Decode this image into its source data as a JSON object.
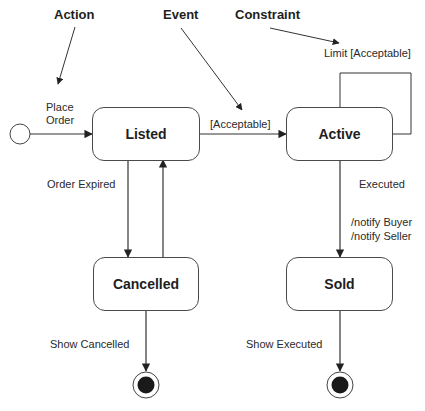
{
  "diagram": {
    "type": "uml-state-machine",
    "annotations": {
      "action": "Action",
      "event": "Event",
      "constraint": "Constraint"
    },
    "states": {
      "listed": "Listed",
      "active": "Active",
      "cancelled": "Cancelled",
      "sold": "Sold"
    },
    "transitions": {
      "place_order_line1": "Place",
      "place_order_line2": "Order",
      "acceptable": "[Acceptable]",
      "limit_acceptable": "Limit [Acceptable]",
      "order_expired": "Order Expired",
      "executed": "Executed",
      "notify_buyer": "/notify Buyer",
      "notify_seller": "/notify Seller",
      "show_cancelled": "Show Cancelled",
      "show_executed": "Show Executed"
    },
    "edges": [
      {
        "from": "initial",
        "to": "Listed",
        "label": "Place Order"
      },
      {
        "from": "Listed",
        "to": "Active",
        "label": "[Acceptable]"
      },
      {
        "from": "Active",
        "to": "Active",
        "label": "Limit [Acceptable]"
      },
      {
        "from": "Listed",
        "to": "Cancelled",
        "label": "Order Expired"
      },
      {
        "from": "Cancelled",
        "to": "Listed",
        "label": ""
      },
      {
        "from": "Active",
        "to": "Sold",
        "label": "Executed /notify Buyer /notify Seller"
      },
      {
        "from": "Cancelled",
        "to": "final",
        "label": "Show Cancelled"
      },
      {
        "from": "Sold",
        "to": "final",
        "label": "Show Executed"
      }
    ],
    "colors": {
      "line": "#333333",
      "final_fill": "#1a1a1a",
      "background": "#ffffff"
    }
  }
}
